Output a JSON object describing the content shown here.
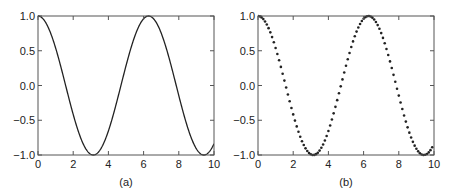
{
  "chart_data": [
    {
      "type": "line",
      "caption": "(a)",
      "title": "",
      "xlabel": "",
      "ylabel": "",
      "function": "cos(x)",
      "xlim": [
        0,
        10
      ],
      "ylim": [
        -1.0,
        1.0
      ],
      "xticks": [
        "0",
        "2",
        "4",
        "6",
        "8",
        "10"
      ],
      "yticks": [
        "1.0",
        "0.5",
        "0.0",
        "−0.5",
        "−1.0"
      ],
      "xtick_values": [
        0,
        2,
        4,
        6,
        8,
        10
      ],
      "ytick_values": [
        1.0,
        0.5,
        0.0,
        -0.5,
        -1.0
      ],
      "grid": false,
      "style": "solid line",
      "x": [
        0,
        1,
        2,
        3,
        3.14,
        4,
        5,
        6,
        6.28,
        7,
        8,
        9,
        9.42,
        10
      ],
      "y": [
        1.0,
        0.54,
        -0.42,
        -0.99,
        -1.0,
        -0.65,
        0.28,
        0.96,
        1.0,
        0.75,
        -0.15,
        -0.91,
        -1.0,
        -0.84
      ]
    },
    {
      "type": "scatter",
      "caption": "(b)",
      "title": "",
      "xlabel": "",
      "ylabel": "",
      "function": "cos(x)",
      "xlim": [
        0,
        10
      ],
      "ylim": [
        -1.0,
        1.0
      ],
      "xticks": [
        "0",
        "2",
        "4",
        "6",
        "8",
        "10"
      ],
      "yticks": [
        "1.0",
        "0.5",
        "0.0",
        "−0.5",
        "−1.0"
      ],
      "xtick_values": [
        0,
        2,
        4,
        6,
        8,
        10
      ],
      "ytick_values": [
        1.0,
        0.5,
        0.0,
        -0.5,
        -1.0
      ],
      "grid": false,
      "style": "dots, 100 points sampled at step 0.1",
      "n_points": 100,
      "x_step": 0.1,
      "x": [
        0,
        1,
        2,
        3,
        3.14,
        4,
        5,
        6,
        6.28,
        7,
        8,
        9,
        9.42,
        10
      ],
      "y": [
        1.0,
        0.54,
        -0.42,
        -0.99,
        -1.0,
        -0.65,
        0.28,
        0.96,
        1.0,
        0.75,
        -0.15,
        -0.91,
        -1.0,
        -0.84
      ]
    }
  ],
  "colors": {
    "line": "#222222",
    "axes": "#555555",
    "text": "#222222"
  }
}
